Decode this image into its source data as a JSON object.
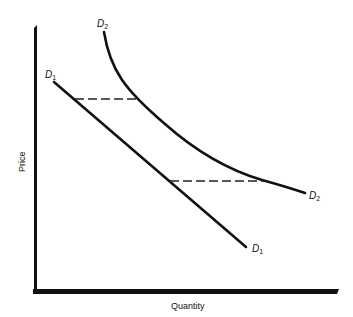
{
  "diagram": {
    "type": "demand-shift",
    "axes": {
      "xlabel": "Quantity",
      "ylabel": "Price"
    },
    "curves": [
      {
        "id": "D1",
        "label_main": "D",
        "label_sub": "1",
        "shape": "linear downward"
      },
      {
        "id": "D2",
        "label_main": "D",
        "label_sub": "2",
        "shape": "convex downward"
      }
    ],
    "dashed_lines": [
      {
        "description": "upper horizontal from D1 to D2"
      },
      {
        "description": "lower horizontal from D1 to D2"
      }
    ],
    "colors": {
      "line": "#111111",
      "background": "#ffffff"
    }
  }
}
